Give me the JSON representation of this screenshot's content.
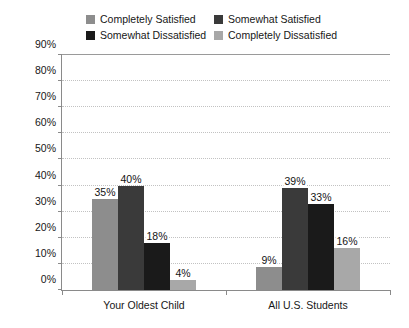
{
  "chart_data": {
    "type": "bar",
    "title": "",
    "xlabel": "",
    "ylabel": "",
    "categories": [
      "Your Oldest Child",
      "All U.S. Students"
    ],
    "series": [
      {
        "name": "Completely Satisfied",
        "color": "#8d8d8d",
        "values": [
          35,
          9
        ],
        "labels": [
          "35%",
          "9%"
        ]
      },
      {
        "name": "Somewhat Satisfied",
        "color": "#3a3a3a",
        "values": [
          40,
          39
        ],
        "labels": [
          "40%",
          "39%"
        ]
      },
      {
        "name": "Somewhat Dissatisfied",
        "color": "#1a1a1a",
        "values": [
          18,
          33
        ],
        "labels": [
          "18%",
          "33%"
        ]
      },
      {
        "name": "Completely Dissatisfied",
        "color": "#a8a8a8",
        "values": [
          4,
          16
        ],
        "labels": [
          "4%",
          "16%"
        ]
      }
    ],
    "ylim": [
      0,
      90
    ],
    "ytick_values": [
      0,
      10,
      20,
      30,
      40,
      50,
      60,
      70,
      80,
      90
    ],
    "ytick_labels": [
      "0%",
      "10%",
      "20%",
      "30%",
      "40%",
      "50%",
      "60%",
      "70%",
      "80%",
      "90%"
    ],
    "grid": true,
    "legend_position": "top"
  },
  "legend": {
    "items": [
      {
        "label": "Completely Satisfied",
        "color": "#8d8d8d"
      },
      {
        "label": "Somewhat Satisfied",
        "color": "#3a3a3a"
      },
      {
        "label": "Somewhat Dissatisfied",
        "color": "#1a1a1a"
      },
      {
        "label": "Completely Dissatisfied",
        "color": "#a8a8a8"
      }
    ]
  }
}
